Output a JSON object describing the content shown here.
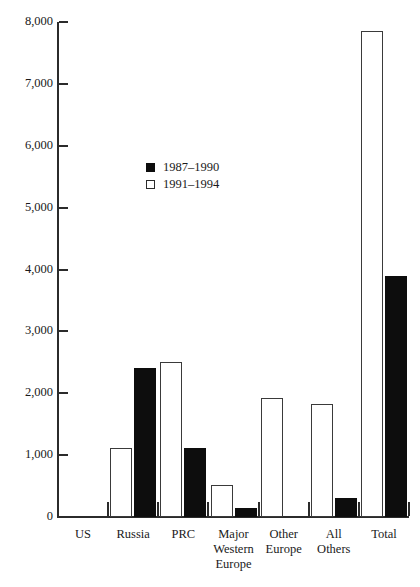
{
  "chart_data": {
    "type": "bar",
    "title": "",
    "xlabel": "",
    "ylabel": "",
    "grid": false,
    "legend_position": "inside-upper-left",
    "ylim": [
      0,
      8000
    ],
    "yticks": [
      0,
      1000,
      2000,
      3000,
      4000,
      5000,
      6000,
      7000,
      8000
    ],
    "ytick_labels": [
      "0",
      "1,000",
      "2,000",
      "3,000",
      "4,000",
      "5,000",
      "6,000",
      "7,000",
      "8,000"
    ],
    "categories": [
      "US",
      "Russia",
      "PRC",
      "Major Western Europe",
      "Other Europe",
      "All Others",
      "Total"
    ],
    "category_lines": [
      [
        "US"
      ],
      [
        "Russia"
      ],
      [
        "PRC"
      ],
      [
        "Major",
        "Western",
        "Europe"
      ],
      [
        "Other",
        "Europe"
      ],
      [
        "All",
        "Others"
      ],
      [
        "Total"
      ]
    ],
    "series": [
      {
        "name": "1987–1990",
        "style": "black",
        "color": "#0d0d0d",
        "values": [
          0,
          2410,
          1120,
          150,
          0,
          310,
          3900
        ]
      },
      {
        "name": "1991–1994",
        "style": "white",
        "color": "#ffffff",
        "values": [
          0,
          1120,
          2500,
          520,
          1930,
          1820,
          7850
        ]
      }
    ]
  },
  "legend": {
    "items": [
      {
        "label": "1987–1990",
        "style": "black"
      },
      {
        "label": "1991–1994",
        "style": "white"
      }
    ]
  }
}
